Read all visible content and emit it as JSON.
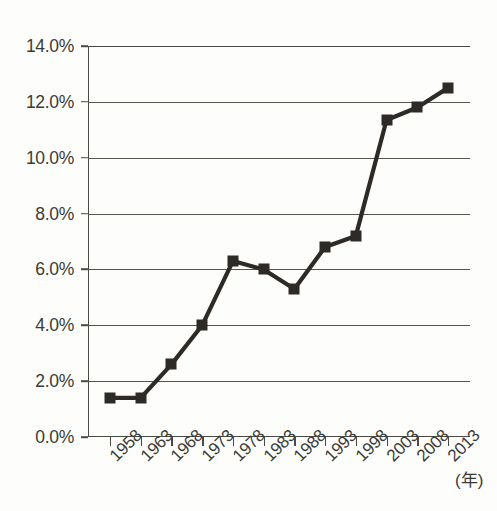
{
  "chart_data": {
    "type": "line",
    "title": "",
    "subtitle": "",
    "xlabel": "(年)",
    "ylabel": "",
    "categories": [
      "1958",
      "1963",
      "1968",
      "1973",
      "1978",
      "1983",
      "1988",
      "1993",
      "1998",
      "2003",
      "2008",
      "2013"
    ],
    "values": [
      1.4,
      1.4,
      2.6,
      4.0,
      6.3,
      6.0,
      5.3,
      6.8,
      7.2,
      11.35,
      11.8,
      12.5
    ],
    "series": [
      {
        "name": "",
        "values": [
          1.4,
          1.4,
          2.6,
          4.0,
          6.3,
          6.0,
          5.3,
          6.8,
          7.2,
          11.35,
          11.8,
          12.5
        ]
      }
    ],
    "ylim": [
      0.0,
      14.0
    ],
    "ytick_values": [
      0.0,
      2.0,
      4.0,
      6.0,
      8.0,
      10.0,
      12.0,
      14.0
    ],
    "ytick_labels": [
      "0.0%",
      "2.0%",
      "4.0%",
      "6.0%",
      "8.0%",
      "10.0%",
      "12.0%",
      "14.0%"
    ],
    "xtick_labels": [
      "1958",
      "1963",
      "1968",
      "1973",
      "1978",
      "1983",
      "1988",
      "1993",
      "1998",
      "2003",
      "2008",
      "2013"
    ],
    "grid": true,
    "grid_axis": "y",
    "legend": null,
    "legend_position": "none",
    "annotations": [],
    "marker": "square",
    "line_color": "#2e2a25",
    "marker_color": "#2e2a25",
    "grid_color": "#55554e",
    "background_color": "#fdfdfb",
    "axis_color": "#4a4a44"
  },
  "axis": {
    "x_unit_label": "(年)"
  }
}
